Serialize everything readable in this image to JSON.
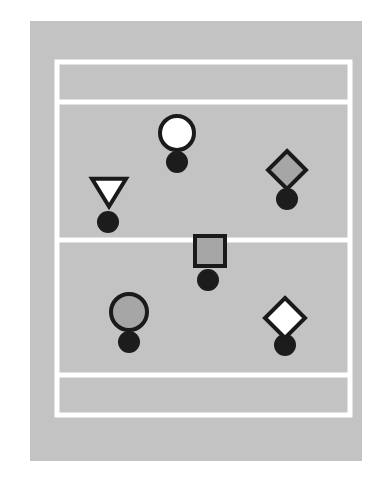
{
  "diagram": {
    "canvas": {
      "width": 392,
      "height": 489,
      "background": "#ffffff"
    },
    "court": {
      "name": "court-surface",
      "x": 30,
      "y": 21,
      "width": 332,
      "height": 440,
      "fill": "#c3c3c3"
    },
    "line_color": "#ffffff",
    "line_width": 5,
    "lines": [
      {
        "name": "court-boundary-outer",
        "type": "rect",
        "x": 57,
        "y": 62,
        "width": 293,
        "height": 353
      },
      {
        "name": "attack-line-top",
        "type": "hline",
        "x1": 57,
        "x2": 350,
        "y": 102
      },
      {
        "name": "center-line",
        "type": "hline",
        "x1": 57,
        "x2": 350,
        "y": 240
      },
      {
        "name": "attack-line-bottom",
        "type": "hline",
        "x1": 57,
        "x2": 350,
        "y": 375
      }
    ],
    "marker_outline_color": "#1a1a1a",
    "marker_outline_width": 4,
    "dot_color": "#1c1c1c",
    "fills": {
      "white": "#ffffff",
      "gray": "#a6a6a6"
    },
    "markers": [
      {
        "name": "marker-circle-white-top",
        "shape": "circle",
        "label": "circle",
        "fill": "white",
        "cx": 177,
        "cy": 133,
        "size": 17,
        "dot": {
          "cx": 177,
          "cy": 162,
          "r": 11
        }
      },
      {
        "name": "marker-triangle-white-left",
        "shape": "triangle-down",
        "label": "triangle",
        "fill": "white",
        "cx": 109,
        "cy": 192,
        "size": 17,
        "dot": {
          "cx": 108,
          "cy": 222,
          "r": 11
        }
      },
      {
        "name": "marker-diamond-gray-right",
        "shape": "diamond",
        "label": "diamond",
        "fill": "gray",
        "cx": 287,
        "cy": 170,
        "size": 19,
        "dot": {
          "cx": 287,
          "cy": 199,
          "r": 11
        }
      },
      {
        "name": "marker-square-gray-center",
        "shape": "square",
        "label": "square",
        "fill": "gray",
        "cx": 210,
        "cy": 251,
        "size": 15,
        "dot": {
          "cx": 208,
          "cy": 280,
          "r": 11
        }
      },
      {
        "name": "marker-circle-gray-bottom-left",
        "shape": "circle",
        "label": "circle",
        "fill": "gray",
        "cx": 129,
        "cy": 312,
        "size": 18,
        "dot": {
          "cx": 129,
          "cy": 342,
          "r": 11
        }
      },
      {
        "name": "marker-diamond-white-bottom-right",
        "shape": "diamond",
        "label": "diamond",
        "fill": "white",
        "cx": 285,
        "cy": 318,
        "size": 20,
        "dot": {
          "cx": 285,
          "cy": 345,
          "r": 11
        }
      }
    ]
  }
}
